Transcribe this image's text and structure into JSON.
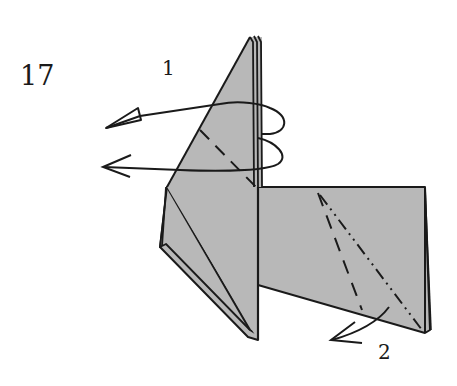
{
  "diagram": {
    "step_number": "17",
    "action_labels": [
      {
        "id": "1",
        "text": "1",
        "description": "rotate/flip upper flap behind (two looping arrows pointing left)"
      },
      {
        "id": "2",
        "text": "2",
        "description": "fold lower right corner (valley fold and mountain fold lines, arrow pointing down-left)"
      }
    ],
    "colors": {
      "paper": "#b8b8b8",
      "line": "#1a1a1a",
      "background": "#ffffff"
    },
    "fold_lines": [
      {
        "type": "valley",
        "style": "dashed",
        "location": "upper flap diagonal"
      },
      {
        "type": "valley",
        "style": "dashed",
        "location": "right panel diagonal"
      },
      {
        "type": "mountain",
        "style": "dash-dot-dot",
        "location": "right panel diagonal"
      }
    ]
  }
}
